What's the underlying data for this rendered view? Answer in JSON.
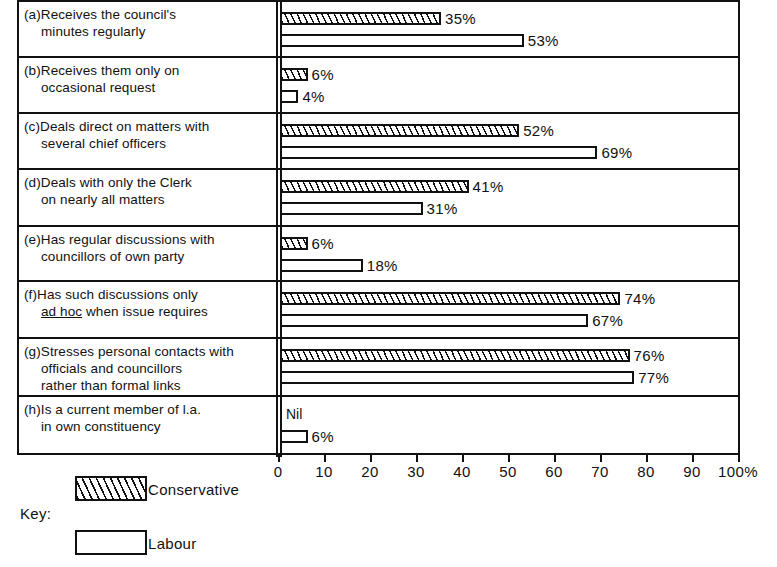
{
  "chart_data": {
    "type": "bar",
    "orientation": "horizontal",
    "title": "",
    "xlabel": "",
    "ylabel": "",
    "xlim": [
      0,
      100
    ],
    "xticks": [
      0,
      10,
      20,
      30,
      40,
      50,
      60,
      70,
      80,
      90,
      100
    ],
    "xtick_labels": [
      "0",
      "10",
      "20",
      "30",
      "40",
      "50",
      "60",
      "70",
      "80",
      "90",
      "100%"
    ],
    "grid": false,
    "legend_position": "below-left",
    "legend_title": "Key:",
    "categories": [
      "(a)Receives the council's minutes regularly",
      "(b)Receives them only on occasional request",
      "(c)Deals direct on matters with several chief officers",
      "(d)Deals with only the Clerk on nearly all matters",
      "(e)Has regular discussions with councillors of own party",
      "(f)Has such discussions only ad hoc when issue requires",
      "(g)Stresses personal contacts with officials and councillors rather than formal links",
      "(h)Is a current member of l.a. in own constituency"
    ],
    "series": [
      {
        "name": "Conservative",
        "values": [
          35,
          6,
          52,
          41,
          6,
          74,
          76,
          null
        ],
        "value_labels": [
          "35%",
          "6%",
          "52%",
          "41%",
          "6%",
          "74%",
          "76%",
          "Nil"
        ]
      },
      {
        "name": "Labour",
        "values": [
          53,
          4,
          69,
          31,
          18,
          67,
          77,
          6
        ],
        "value_labels": [
          "53%",
          "4%",
          "69%",
          "31%",
          "18%",
          "67%",
          "77%",
          "6%"
        ]
      }
    ]
  },
  "rows": [
    {
      "id": "a",
      "lines": [
        "(a)Receives the council's",
        "minutes regularly"
      ],
      "underline_index": -1,
      "cons": {
        "value": 35,
        "label": "35%"
      },
      "lab": {
        "value": 53,
        "label": "53%"
      }
    },
    {
      "id": "b",
      "lines": [
        "(b)Receives them only on",
        "occasional request"
      ],
      "underline_index": -1,
      "cons": {
        "value": 6,
        "label": "6%"
      },
      "lab": {
        "value": 4,
        "label": "4%"
      }
    },
    {
      "id": "c",
      "lines": [
        "(c)Deals direct on matters with",
        "several chief officers"
      ],
      "underline_index": -1,
      "cons": {
        "value": 52,
        "label": "52%"
      },
      "lab": {
        "value": 69,
        "label": "69%"
      }
    },
    {
      "id": "d",
      "lines": [
        "(d)Deals with only the Clerk",
        "on nearly all matters"
      ],
      "underline_index": -1,
      "cons": {
        "value": 41,
        "label": "41%"
      },
      "lab": {
        "value": 31,
        "label": "31%"
      }
    },
    {
      "id": "e",
      "lines": [
        "(e)Has regular discussions with",
        "councillors of own party"
      ],
      "underline_index": -1,
      "cons": {
        "value": 6,
        "label": "6%"
      },
      "lab": {
        "value": 18,
        "label": "18%"
      }
    },
    {
      "id": "f",
      "lines": [
        "(f)Has such discussions only",
        "ad hoc when issue requires"
      ],
      "underline_index": 1,
      "cons": {
        "value": 74,
        "label": "74%"
      },
      "lab": {
        "value": 67,
        "label": "67%"
      }
    },
    {
      "id": "g",
      "lines": [
        "(g)Stresses personal contacts with",
        "officials and councillors",
        "rather than formal links"
      ],
      "underline_index": -1,
      "cons": {
        "value": 76,
        "label": "76%"
      },
      "lab": {
        "value": 77,
        "label": "77%"
      }
    },
    {
      "id": "h",
      "lines": [
        "(h)Is a current member of l.a.",
        "in own constituency"
      ],
      "underline_index": -1,
      "cons": {
        "value": null,
        "label": "Nil"
      },
      "lab": {
        "value": 6,
        "label": "6%"
      }
    }
  ],
  "axis": {
    "ticks": [
      {
        "value": 0,
        "label": "0"
      },
      {
        "value": 10,
        "label": "10"
      },
      {
        "value": 20,
        "label": "20"
      },
      {
        "value": 30,
        "label": "30"
      },
      {
        "value": 40,
        "label": "40"
      },
      {
        "value": 50,
        "label": "50"
      },
      {
        "value": 60,
        "label": "60"
      },
      {
        "value": 70,
        "label": "70"
      },
      {
        "value": 80,
        "label": "80"
      },
      {
        "value": 90,
        "label": "90"
      },
      {
        "value": 100,
        "label": "100%"
      }
    ]
  },
  "legend": {
    "key_label": "Key:",
    "items": [
      {
        "name": "conservative",
        "label": "Conservative",
        "pattern": "hatched"
      },
      {
        "name": "labour",
        "label": "Labour",
        "pattern": "plain"
      }
    ]
  },
  "colors": {
    "ink": "#111111",
    "paper": "#ffffff"
  }
}
